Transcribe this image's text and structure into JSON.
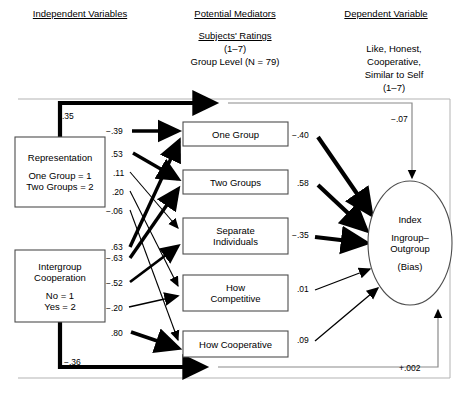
{
  "figure": {
    "type": "path-diagram",
    "headers": {
      "independent": "Independent Variables",
      "mediators": "Potential Mediators",
      "dependent": "Dependent Variable"
    },
    "mediator_sub": {
      "line1": "Subjects' Ratings",
      "line2": "(1–7)",
      "line3": "Group Level (N = 79)"
    },
    "dependent_sub": {
      "line1": "Like, Honest,",
      "line2": "Cooperative,",
      "line3": "Similar to Self",
      "line4": "(1–7)"
    }
  },
  "independent_vars": [
    {
      "id": "representation",
      "title": "Representation",
      "levels": [
        "One Group = 1",
        "Two Groups = 2"
      ],
      "x": 15,
      "y": 137,
      "w": 90,
      "h": 70
    },
    {
      "id": "intergroup-cooperation",
      "title_lines": [
        "Intergroup",
        "Cooperation"
      ],
      "levels": [
        "No = 1",
        "Yes = 2"
      ],
      "x": 15,
      "y": 250,
      "w": 90,
      "h": 72
    }
  ],
  "mediators": [
    {
      "id": "one-group",
      "lines": [
        "One Group"
      ],
      "x": 183,
      "y": 122,
      "w": 105,
      "h": 24
    },
    {
      "id": "two-groups",
      "lines": [
        "Two Groups"
      ],
      "x": 183,
      "y": 170,
      "w": 105,
      "h": 24
    },
    {
      "id": "separate-individuals",
      "lines": [
        "Separate",
        "Individuals"
      ],
      "x": 183,
      "y": 218,
      "w": 105,
      "h": 36
    },
    {
      "id": "how-competitive",
      "lines": [
        "How",
        "Competitive"
      ],
      "x": 183,
      "y": 275,
      "w": 105,
      "h": 36
    },
    {
      "id": "how-cooperative",
      "lines": [
        "How Cooperative"
      ],
      "x": 183,
      "y": 331,
      "w": 105,
      "h": 26
    }
  ],
  "dependent_var": {
    "id": "index-ingroup-outgroup",
    "lines": [
      "Index",
      "Ingroup–",
      "Outgroup",
      "(Bias)"
    ],
    "cx": 410,
    "cy": 243,
    "rx": 42,
    "ry": 62
  },
  "coefficients": {
    "direct_top": {
      "value": ".35",
      "x": 62,
      "y": 111
    },
    "direct_bottom": {
      "value": "−.36",
      "x": 64,
      "y": 357
    },
    "total_top": {
      "value": "−.07",
      "x": 391,
      "y": 114
    },
    "total_bottom": {
      "value": "+.002",
      "x": 399,
      "y": 363
    },
    "iv_to_mediator": [
      {
        "value": "−.39",
        "x": 106,
        "y": 126,
        "from": "representation",
        "to": "one-group"
      },
      {
        "value": ".53",
        "x": 111,
        "y": 149,
        "from": "representation",
        "to": "two-groups"
      },
      {
        "value": ".11",
        "x": 113,
        "y": 168,
        "from": "representation",
        "to": "separate-individuals"
      },
      {
        "value": ".20",
        "x": 112,
        "y": 187,
        "from": "representation",
        "to": "how-competitive"
      },
      {
        "value": "−.06",
        "x": 106,
        "y": 206,
        "from": "representation",
        "to": "how-cooperative"
      },
      {
        "value": ".63",
        "x": 111,
        "y": 242,
        "from": "intergroup-cooperation",
        "to": "one-group"
      },
      {
        "value": "−.63",
        "x": 106,
        "y": 253,
        "from": "intergroup-cooperation",
        "to": "two-groups"
      },
      {
        "value": "−.52",
        "x": 106,
        "y": 278,
        "from": "intergroup-cooperation",
        "to": "separate-individuals"
      },
      {
        "value": "−.20",
        "x": 106,
        "y": 303,
        "from": "intergroup-cooperation",
        "to": "how-competitive"
      },
      {
        "value": ".80",
        "x": 111,
        "y": 328,
        "from": "intergroup-cooperation",
        "to": "how-cooperative"
      }
    ],
    "mediator_to_dv": [
      {
        "value": "−.40",
        "x": 292,
        "y": 130,
        "from": "one-group"
      },
      {
        "value": ".58",
        "x": 297,
        "y": 178,
        "from": "two-groups"
      },
      {
        "value": "−.35",
        "x": 292,
        "y": 230,
        "from": "separate-individuals"
      },
      {
        "value": ".01",
        "x": 297,
        "y": 284,
        "from": "how-competitive"
      },
      {
        "value": ".09",
        "x": 297,
        "y": 335,
        "from": "how-cooperative"
      }
    ]
  },
  "style": {
    "stroke": "#000000",
    "thin_stroke": "#808080",
    "box_border": "#4d4d4d",
    "frame": "#9a9a9a"
  }
}
